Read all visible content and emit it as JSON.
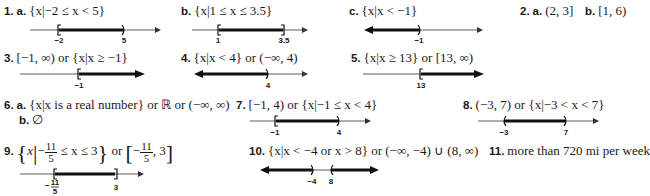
{
  "answers": [
    {
      "id": "1a",
      "number": "1.",
      "part": "a.",
      "text": "{x|−2 ≤ x < 5}",
      "number_line": {
        "range": [
          -4,
          8
        ],
        "arrow_right": true,
        "arrow_left": false,
        "ticks": [
          {
            "value": -2,
            "label": "−2",
            "bracket": "["
          },
          {
            "value": 5,
            "label": "5",
            "bracket": ")"
          }
        ],
        "shaded": [
          [
            -2,
            5
          ]
        ]
      }
    },
    {
      "id": "1b",
      "part": "b.",
      "text": "{x|1 ≤ x ≤ 3.5}",
      "number_line": {
        "ticks": [
          {
            "value": 1,
            "label": "1",
            "bracket": "["
          },
          {
            "value": 3.5,
            "label": "3.5",
            "bracket": "]"
          }
        ],
        "shaded": [
          [
            1,
            3.5
          ]
        ]
      }
    },
    {
      "id": "1c",
      "part": "c.",
      "text": "{x|x < −1}",
      "number_line": {
        "ticks": [
          {
            "value": -1,
            "label": "−1",
            "bracket": ")"
          }
        ],
        "shaded": [
          [
            "-inf",
            -1
          ]
        ]
      }
    },
    {
      "id": "2a",
      "number": "2.",
      "part": "a.",
      "text": "(2, 3]"
    },
    {
      "id": "2b",
      "part": "b.",
      "text": "[1, 6)"
    },
    {
      "id": "3",
      "number": "3.",
      "text": "[−1, ∞) or {x|x ≥ −1}",
      "number_line": {
        "ticks": [
          {
            "value": -1,
            "label": "−1",
            "bracket": "["
          }
        ],
        "shaded": [
          [
            -1,
            "inf"
          ]
        ]
      }
    },
    {
      "id": "4",
      "number": "4.",
      "text": "{x|x < 4} or (−∞, 4)",
      "number_line": {
        "ticks": [
          {
            "value": 4,
            "label": "4",
            "bracket": ")"
          }
        ],
        "shaded": [
          [
            "-inf",
            4
          ]
        ]
      }
    },
    {
      "id": "5",
      "number": "5.",
      "text": "{x|x ≥ 13} or [13, ∞)",
      "number_line": {
        "ticks": [
          {
            "value": 13,
            "label": "13",
            "bracket": "["
          }
        ],
        "shaded": [
          [
            13,
            "inf"
          ]
        ]
      }
    },
    {
      "id": "6a",
      "number": "6.",
      "part": "a.",
      "text": "{x|x is a real number} or ℝ or (−∞, ∞)"
    },
    {
      "id": "6b",
      "part": "b.",
      "text": "∅"
    },
    {
      "id": "7",
      "number": "7.",
      "text": "[−1, 4) or {x|−1 ≤ x < 4}",
      "number_line": {
        "ticks": [
          {
            "value": -1,
            "label": "−1",
            "bracket": "["
          },
          {
            "value": 4,
            "label": "4",
            "bracket": ")"
          }
        ],
        "shaded": [
          [
            -1,
            4
          ]
        ]
      }
    },
    {
      "id": "8",
      "number": "8.",
      "text": "(−3, 7) or {x|−3 < x < 7}",
      "number_line": {
        "ticks": [
          {
            "value": -3,
            "label": "−3",
            "bracket": "("
          },
          {
            "value": 7,
            "label": "7",
            "bracket": ")"
          }
        ],
        "shaded": [
          [
            -3,
            7
          ]
        ]
      }
    },
    {
      "id": "9",
      "number": "9.",
      "text_parts": {
        "set_open": "{",
        "var": "x",
        "frac_num": "11",
        "frac_den": "5",
        "neg": "−",
        "middle": " ≤ x ≤ 3",
        "set_close": "}",
        "or": " or ",
        "int_open": "[",
        "int_tail": ", 3",
        "int_close": "]"
      },
      "number_line": {
        "ticks": [
          {
            "value": -2.2,
            "label": "−11/5",
            "bracket": "["
          },
          {
            "value": 3,
            "label": "3",
            "bracket": "]"
          }
        ],
        "shaded": [
          [
            -2.2,
            3
          ]
        ]
      }
    },
    {
      "id": "10",
      "number": "10.",
      "text": "{x|x < −4 or x > 8} or (−∞, −4) ∪ (8, ∞)",
      "number_line": {
        "ticks": [
          {
            "value": -4,
            "label": "−4",
            "bracket": ")"
          },
          {
            "value": 8,
            "label": "8",
            "bracket": "("
          }
        ],
        "shaded": [
          [
            "-inf",
            -4
          ],
          [
            8,
            "inf"
          ]
        ]
      }
    },
    {
      "id": "11",
      "number": "11.",
      "text": "more than 720 mi per week"
    }
  ]
}
